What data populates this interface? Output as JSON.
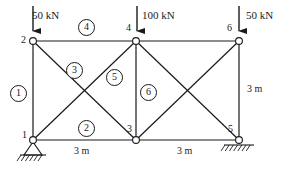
{
  "figure": {
    "type": "truss-diagram",
    "stroke_color": "#1a1a1a",
    "background": "#ffffff"
  },
  "loads": [
    {
      "name": "load-at-node-2",
      "label": "50 kN",
      "magnitude": 50,
      "unit": "kN",
      "direction": "down",
      "at_node": "2",
      "text_x": 32,
      "text_y": 10,
      "arrow_x": 33,
      "arrow_y0": 6,
      "arrow_y1": 40
    },
    {
      "name": "load-at-node-4",
      "label": "100 kN",
      "magnitude": 100,
      "unit": "kN",
      "direction": "down",
      "at_node": "4",
      "text_x": 142,
      "text_y": 10,
      "arrow_x": 137,
      "arrow_y0": 6,
      "arrow_y1": 40
    },
    {
      "name": "load-at-node-6",
      "label": "50 kN",
      "magnitude": 50,
      "unit": "kN",
      "direction": "down",
      "at_node": "6",
      "text_x": 246,
      "text_y": 10,
      "arrow_x": 239,
      "arrow_y0": 6,
      "arrow_y1": 40
    }
  ],
  "nodes": [
    {
      "id": "1",
      "label": "1",
      "x": 33,
      "y": 140,
      "label_x": 22,
      "label_y": 130,
      "support": "pinned"
    },
    {
      "id": "2",
      "label": "2",
      "x": 33,
      "y": 41,
      "label_x": 21,
      "label_y": 35,
      "support": "none"
    },
    {
      "id": "3",
      "label": "3",
      "x": 136,
      "y": 140,
      "label_x": 127,
      "label_y": 124,
      "support": "none"
    },
    {
      "id": "4",
      "label": "4",
      "x": 136,
      "y": 41,
      "label_x": 126,
      "label_y": 23,
      "support": "none"
    },
    {
      "id": "5",
      "label": "5",
      "x": 239,
      "y": 140,
      "label_x": 228,
      "label_y": 124,
      "support": "roller"
    },
    {
      "id": "6",
      "label": "6",
      "x": 239,
      "y": 41,
      "label_x": 227,
      "label_y": 23,
      "support": "none"
    }
  ],
  "members": [
    {
      "id": "left-vertical",
      "from": "2",
      "to": "1",
      "numbered": true,
      "number": "1",
      "num_x": 10,
      "num_y": 85
    },
    {
      "id": "bottom-left-chord",
      "from": "1",
      "to": "3",
      "numbered": true,
      "number": "2",
      "num_x": 78,
      "num_y": 120
    },
    {
      "id": "diagonal-2-3",
      "from": "2",
      "to": "3",
      "numbered": true,
      "number": "3",
      "num_x": 66,
      "num_y": 62
    },
    {
      "id": "top-left-chord",
      "from": "2",
      "to": "4",
      "numbered": true,
      "number": "4",
      "num_x": 78,
      "num_y": 19
    },
    {
      "id": "diagonal-1-4",
      "from": "1",
      "to": "4",
      "numbered": true,
      "number": "5",
      "num_x": 106,
      "num_y": 69
    },
    {
      "id": "center-vertical",
      "from": "4",
      "to": "3",
      "numbered": true,
      "number": "6",
      "num_x": 140,
      "num_y": 84
    },
    {
      "id": "top-right-chord",
      "from": "4",
      "to": "6",
      "numbered": false,
      "number": "",
      "num_x": 0,
      "num_y": 0
    },
    {
      "id": "bottom-right-chord",
      "from": "3",
      "to": "5",
      "numbered": false,
      "number": "",
      "num_x": 0,
      "num_y": 0
    },
    {
      "id": "diagonal-4-5",
      "from": "4",
      "to": "5",
      "numbered": false,
      "number": "",
      "num_x": 0,
      "num_y": 0
    },
    {
      "id": "diagonal-3-6",
      "from": "3",
      "to": "6",
      "numbered": false,
      "number": "",
      "num_x": 0,
      "num_y": 0
    },
    {
      "id": "right-vertical",
      "from": "6",
      "to": "5",
      "numbered": false,
      "number": "",
      "num_x": 0,
      "num_y": 0
    }
  ],
  "dimensions": [
    {
      "name": "span-left",
      "label": "3 m",
      "x": 74,
      "y": 146,
      "orientation": "horizontal"
    },
    {
      "name": "span-right",
      "label": "3 m",
      "x": 177,
      "y": 146,
      "orientation": "horizontal"
    },
    {
      "name": "height-right",
      "label": "3 m",
      "x": 247,
      "y": 84,
      "orientation": "vertical"
    }
  ],
  "chart_data": {
    "type": "diagram",
    "title": "",
    "span_total_m": 6,
    "height_m": 3,
    "bay_widths_m": [
      3,
      3
    ],
    "node_coordinates_m": {
      "1": [
        0,
        0
      ],
      "2": [
        0,
        3
      ],
      "3": [
        3,
        0
      ],
      "4": [
        3,
        3
      ],
      "5": [
        6,
        0
      ],
      "6": [
        6,
        3
      ]
    },
    "member_connectivity": {
      "1": [
        "2",
        "1"
      ],
      "2": [
        "1",
        "3"
      ],
      "3": [
        "2",
        "3"
      ],
      "4": [
        "2",
        "4"
      ],
      "5": [
        "1",
        "4"
      ],
      "6": [
        "4",
        "3"
      ]
    },
    "applied_loads_kN": {
      "2": -50,
      "4": -100,
      "6": -50
    },
    "supports": {
      "1": "pinned",
      "5": "roller"
    }
  }
}
